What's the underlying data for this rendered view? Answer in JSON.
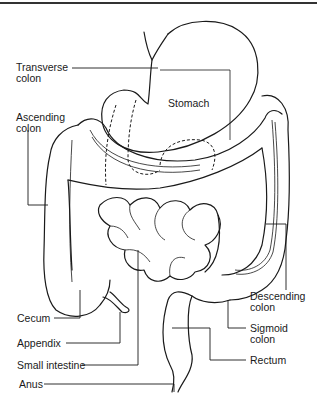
{
  "diagram": {
    "labels": {
      "transverse_colon": "Transverse\ncolon",
      "ascending_colon": "Ascending\ncolon",
      "stomach": "Stomach",
      "cecum": "Cecum",
      "appendix": "Appendix",
      "small_intestine": "Small intestine",
      "anus": "Anus",
      "descending_colon": "Descending\ncolon",
      "sigmoid_colon": "Sigmoid\ncolon",
      "rectum": "Rectum"
    },
    "colors": {
      "line": "#1a1a1a",
      "background": "#ffffff"
    }
  }
}
